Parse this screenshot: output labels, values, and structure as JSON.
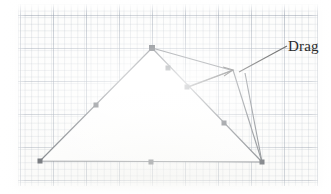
{
  "figure": {
    "background": "graph-paper",
    "annotation": {
      "label": "Drag",
      "label_x": 288,
      "label_y": 38
    },
    "colors": {
      "stroke": "#5a5f66",
      "vertex": "#4a4f56",
      "annotation_stroke": "#3a3a3a",
      "grid_minor": "#96a0af",
      "grid_major": "#7884 96",
      "paper": "#fdfdfc",
      "interior": "#ffffff",
      "text": "#2b2b2b"
    },
    "polygon": {
      "name": "triangle-outline",
      "vertices": [
        {
          "name": "apex",
          "x": 152,
          "y": 48
        },
        {
          "name": "bottom-right",
          "x": 262,
          "y": 162
        },
        {
          "name": "bottom-left",
          "x": 40,
          "y": 161
        }
      ]
    },
    "vertex_markers": [
      {
        "name": "marker-bottom-left",
        "x": 40,
        "y": 161,
        "shape": "square",
        "size": 5
      },
      {
        "name": "marker-left-edge-mid",
        "x": 96,
        "y": 105,
        "shape": "square",
        "size": 5
      },
      {
        "name": "marker-apex",
        "x": 152,
        "y": 48,
        "shape": "square",
        "size": 6
      },
      {
        "name": "marker-right-upper",
        "x": 168,
        "y": 68,
        "shape": "square",
        "size": 5
      },
      {
        "name": "marker-right-mid",
        "x": 187,
        "y": 87,
        "shape": "square",
        "size": 5
      },
      {
        "name": "marker-right-lower",
        "x": 224,
        "y": 123,
        "shape": "square",
        "size": 5
      },
      {
        "name": "marker-bottom-mid",
        "x": 151,
        "y": 162,
        "shape": "square",
        "size": 5
      },
      {
        "name": "marker-bottom-right",
        "x": 262,
        "y": 162,
        "shape": "square",
        "size": 5
      }
    ],
    "drag_target": {
      "name": "drag-handle-point",
      "x": 234,
      "y": 71
    },
    "drag_edges": [
      {
        "name": "drag-edge-from-apex",
        "x1": 152,
        "y1": 48,
        "x2": 234,
        "y2": 71
      },
      {
        "name": "drag-edge-from-midpoint",
        "x1": 187,
        "y1": 87,
        "x2": 234,
        "y2": 71
      },
      {
        "name": "drag-edge-down-left",
        "x1": 234,
        "y1": 71,
        "x2": 262,
        "y2": 162
      },
      {
        "name": "drag-edge-down-right",
        "x1": 245,
        "y1": 72,
        "x2": 262,
        "y2": 162
      }
    ],
    "arrow": {
      "name": "drag-direction-arrow",
      "tail_x": 186,
      "tail_y": 88,
      "head_x": 233,
      "head_y": 70
    },
    "leader_line": {
      "name": "drag-label-leader",
      "x1": 286,
      "y1": 47,
      "x2": 240,
      "y2": 72
    }
  }
}
